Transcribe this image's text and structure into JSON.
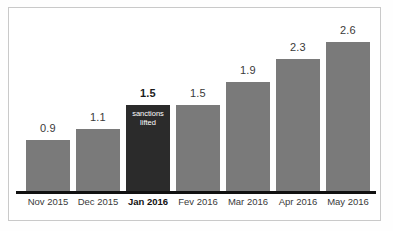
{
  "chart_data": {
    "type": "bar",
    "title": "",
    "subtitle": "",
    "xlabel": "",
    "ylabel": "",
    "grid": false,
    "legend": null,
    "ylim": [
      0,
      2.9
    ],
    "categories": [
      "Nov 2015",
      "Dec 2015",
      "Jan 2016",
      "Fev 2016",
      "Mar 2016",
      "Apr 2016",
      "May 2016"
    ],
    "values": [
      0.9,
      1.1,
      1.5,
      1.5,
      1.9,
      2.3,
      2.6
    ],
    "value_labels": [
      "0.9",
      "1.1",
      "1.5",
      "1.5",
      "1.9",
      "2.3",
      "2.6"
    ],
    "highlight_index": 2,
    "annotations": [
      {
        "index": 2,
        "lines": [
          "sanctions",
          "lifted"
        ],
        "placement": "inside-bar-top"
      }
    ],
    "colors": {
      "bar": "#7a7a7a",
      "bar_highlight": "#2b2b2b",
      "axis": "#111111",
      "label": "#3a3a3a",
      "label_highlight": "#111111",
      "annotation_text": "#ffffff",
      "background": "#ffffff",
      "frame": "#c9c9c9"
    },
    "bars": [
      {
        "category": "Nov 2015",
        "value": 0.9,
        "value_label": "0.9",
        "highlight": false,
        "bold_label": false,
        "note": []
      },
      {
        "category": "Dec 2015",
        "value": 1.1,
        "value_label": "1.1",
        "highlight": false,
        "bold_label": false,
        "note": []
      },
      {
        "category": "Jan 2016",
        "value": 1.5,
        "value_label": "1.5",
        "highlight": true,
        "bold_label": true,
        "note": [
          "sanctions",
          "lifted"
        ]
      },
      {
        "category": "Fev 2016",
        "value": 1.5,
        "value_label": "1.5",
        "highlight": false,
        "bold_label": false,
        "note": []
      },
      {
        "category": "Mar 2016",
        "value": 1.9,
        "value_label": "1.9",
        "highlight": false,
        "bold_label": false,
        "note": []
      },
      {
        "category": "Apr 2016",
        "value": 2.3,
        "value_label": "2.3",
        "highlight": false,
        "bold_label": false,
        "note": []
      },
      {
        "category": "May 2016",
        "value": 2.6,
        "value_label": "2.6",
        "highlight": false,
        "bold_label": false,
        "note": []
      }
    ]
  }
}
